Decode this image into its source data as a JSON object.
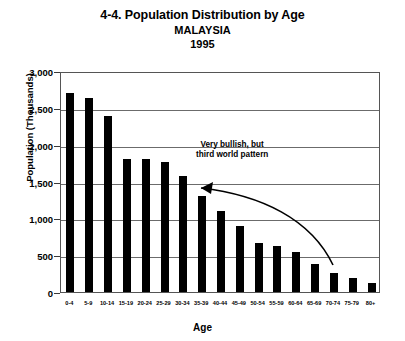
{
  "chart_data": {
    "type": "bar",
    "title": "4-4. Population Distribution by Age",
    "subtitle": "MALAYSIA",
    "year": "1995",
    "xlabel": "Age",
    "ylabel": "Population (Thousands)",
    "ylim": [
      0,
      3000
    ],
    "ytick_labels": [
      "3,000",
      "2,500",
      "2,000",
      "1,500",
      "1,000",
      "500",
      "0"
    ],
    "ytick_values": [
      3000,
      2500,
      2000,
      1500,
      1000,
      500,
      0
    ],
    "grid": true,
    "legend": "none",
    "bar_color": "#000000",
    "categories": [
      "0-4",
      "5-9",
      "10-14",
      "15-19",
      "20-24",
      "25-29",
      "30-34",
      "35-39",
      "40-44",
      "45-49",
      "50-54",
      "55-59",
      "60-64",
      "65-69",
      "70-74",
      "75-79",
      "80+"
    ],
    "values": [
      2700,
      2630,
      2390,
      1800,
      1800,
      1760,
      1570,
      1300,
      1100,
      890,
      660,
      620,
      540,
      380,
      260,
      190,
      120
    ],
    "annotations": [
      {
        "text_line1": "Very bullish, but",
        "text_line2": "third world pattern",
        "arrow": "curved-arrow-pointing-left"
      }
    ]
  }
}
